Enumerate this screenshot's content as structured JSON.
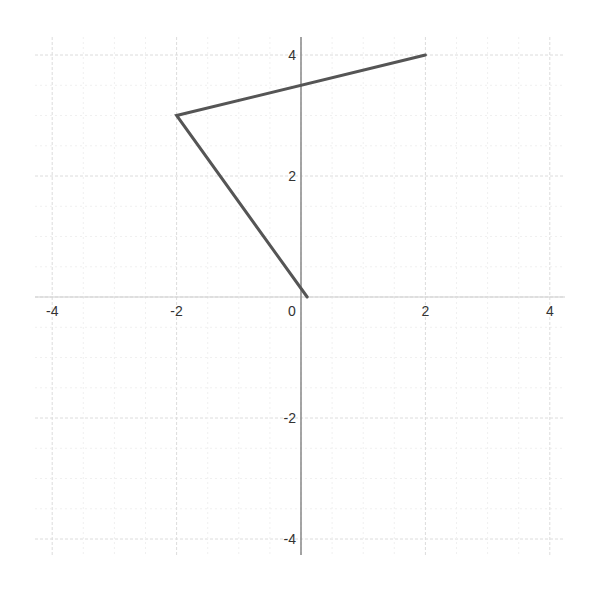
{
  "chart_data": {
    "type": "line",
    "title": "",
    "xlabel": "",
    "ylabel": "",
    "xlim": [
      -4.4,
      4.4
    ],
    "ylim": [
      -4.3,
      4.3
    ],
    "grid": true,
    "x_ticks": [
      -4,
      -2,
      0,
      2,
      4
    ],
    "y_ticks": [
      4,
      2,
      -2,
      -4
    ],
    "x_tick_labels": [
      "-4",
      "-2",
      "0",
      "2",
      "4"
    ],
    "y_tick_labels": [
      "4",
      "2",
      "-2",
      "-4"
    ],
    "series": [
      {
        "name": "polyline",
        "points": [
          {
            "x": 2,
            "y": 4
          },
          {
            "x": -2,
            "y": 3
          },
          {
            "x": 0.1,
            "y": 0
          }
        ],
        "color": "#555555"
      }
    ]
  },
  "colors": {
    "line": "#555555",
    "axis": "#888888",
    "grid": "#e6e6e6",
    "label": "#333333"
  }
}
